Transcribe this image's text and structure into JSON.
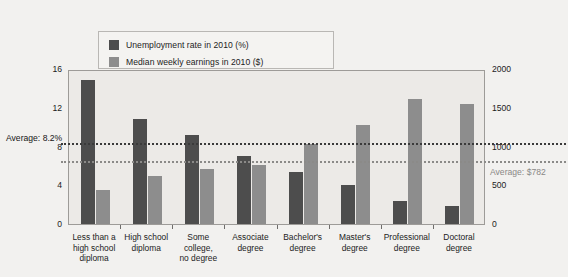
{
  "legend": {
    "items": [
      {
        "label": "Unemployment rate in 2010 (%)",
        "color": "#4d4d4d",
        "icon": "square-swatch-dark"
      },
      {
        "label": "Median weekly earnings in 2010 ($)",
        "color": "#8d8d8d",
        "icon": "square-swatch-light"
      }
    ]
  },
  "annotations": {
    "unemployment_average": "Average: 8.2%",
    "earnings_average": "Average: $782"
  },
  "chart_data": {
    "type": "bar",
    "title": "",
    "subtitle": "",
    "xlabel": "",
    "ylabel": "",
    "y2label": "",
    "grid": false,
    "legend_position": "top-left",
    "categories": [
      "Less than a high school diploma",
      "High school diploma",
      "Some college, no degree",
      "Associate degree",
      "Bachelor's degree",
      "Master's degree",
      "Professional degree",
      "Doctoral degree"
    ],
    "category_lines": [
      [
        "Less than a",
        "high school",
        "diploma"
      ],
      [
        "High school",
        "diploma"
      ],
      [
        "Some",
        "college,",
        "no degree"
      ],
      [
        "Associate",
        "degree"
      ],
      [
        "Bachelor's",
        "degree"
      ],
      [
        "Master's",
        "degree"
      ],
      [
        "Professional",
        "degree"
      ],
      [
        "Doctoral",
        "degree"
      ]
    ],
    "series": [
      {
        "name": "Unemployment rate in 2010 (%)",
        "axis": "left",
        "color": "#4d4d4d",
        "values": [
          14.9,
          10.8,
          9.2,
          7.0,
          5.4,
          4.0,
          2.4,
          1.9
        ]
      },
      {
        "name": "Median weekly earnings in 2010 ($)",
        "axis": "right",
        "color": "#8d8d8d",
        "values": [
          444,
          626,
          712,
          767,
          1038,
          1272,
          1610,
          1550
        ]
      }
    ],
    "ylim": [
      0,
      16
    ],
    "yticks": [
      0,
      4,
      8,
      12,
      16
    ],
    "ytick_labels": [
      "0",
      "4",
      "8",
      "12",
      "16"
    ],
    "y2lim": [
      0,
      2000
    ],
    "y2ticks": [
      0,
      500,
      1000,
      1500,
      2000
    ],
    "y2tick_labels": [
      "0",
      "500",
      "1000",
      "1500",
      "2000"
    ],
    "reference_lines": [
      {
        "label": "Average: 8.2%",
        "axis": "left",
        "value": 8.2,
        "style": "dotted",
        "color": "#3a3a3a"
      },
      {
        "label": "Average: $782",
        "axis": "right",
        "value": 782,
        "style": "dotted",
        "color": "#8b8a88"
      }
    ]
  }
}
